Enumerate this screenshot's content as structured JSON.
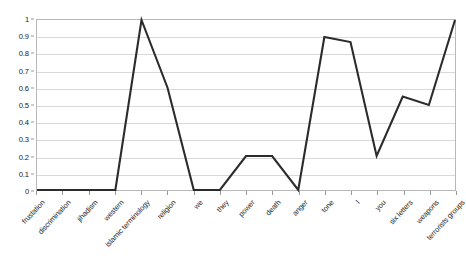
{
  "chart_data": {
    "type": "line",
    "title": "",
    "subtitle": "",
    "xlabel": "",
    "ylabel": "",
    "ylim": [
      0,
      1
    ],
    "ytick_labels": [
      "1",
      "0.9",
      "0.8",
      "0.7",
      "0.6",
      "0.5",
      "0.4",
      "0.3",
      "0.2",
      "0.1",
      "0"
    ],
    "ytick_values": [
      1,
      0.9,
      0.8,
      0.7,
      0.6,
      0.5,
      0.4,
      0.3,
      0.2,
      0.1,
      0
    ],
    "grid": true,
    "legend": "none",
    "categories": [
      "frustation",
      "discrimination",
      "jihadism",
      "western",
      "islamic terminology",
      "religion",
      "we",
      "they",
      "power",
      "death",
      "anger",
      "tone",
      "I",
      "you",
      "six letters",
      "weapons",
      "terrorists groups"
    ],
    "values": [
      0,
      0,
      0,
      0,
      1,
      0.6,
      0,
      0,
      0.2,
      0.2,
      0,
      0.9,
      0.87,
      0.2,
      0.55,
      0.5,
      1
    ],
    "series": [
      {
        "name": "",
        "values": [
          0,
          0,
          0,
          0,
          1,
          0.6,
          0,
          0,
          0.2,
          0.2,
          0,
          0.9,
          0.87,
          0.2,
          0.55,
          0.5,
          1
        ]
      }
    ],
    "line_color": "#2b2b2b",
    "grid_color": "#d9d9d9",
    "border_color": "#b8b8b8",
    "background_color": "#ffffff"
  }
}
